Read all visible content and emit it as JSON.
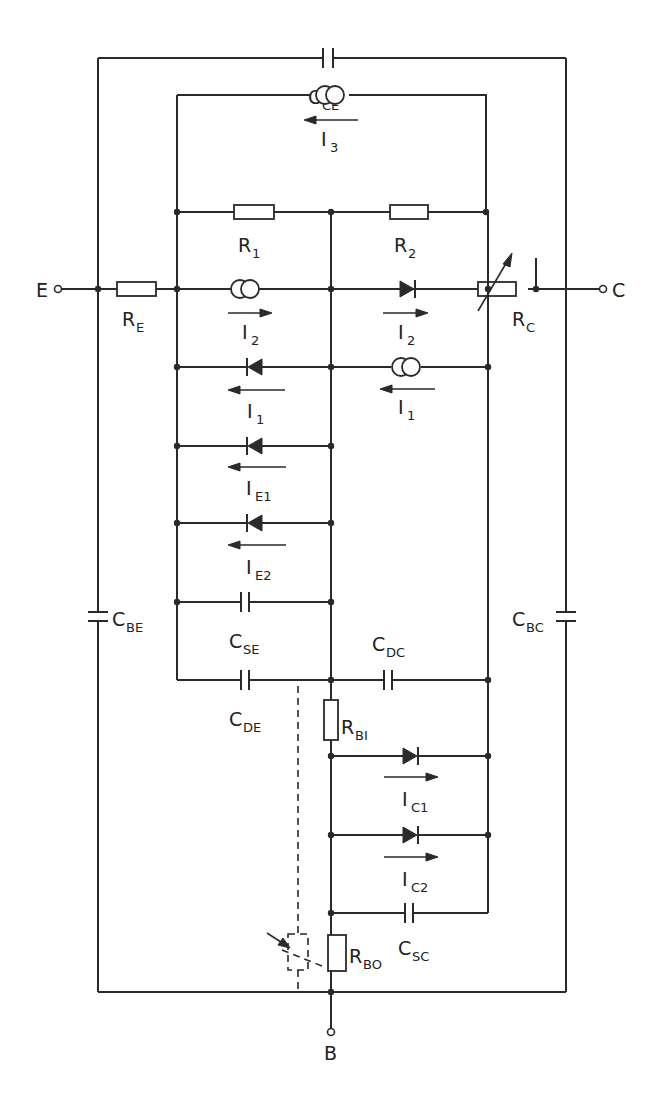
{
  "figure": {
    "type": "equivalent-circuit-schematic",
    "colors": {
      "line": "#2a2a2a",
      "background": "#ffffff"
    }
  },
  "terminals": {
    "emitter": {
      "label": "E"
    },
    "collector": {
      "label": "C"
    },
    "base": {
      "label": "B"
    }
  },
  "components": {
    "C_CE": {
      "main": "C",
      "sub": "CE",
      "kind": "capacitor"
    },
    "I_3": {
      "main": "I",
      "sub": "3",
      "kind": "current-source",
      "arrow": "left"
    },
    "R_1": {
      "main": "R",
      "sub": "1",
      "kind": "resistor"
    },
    "R_2": {
      "main": "R",
      "sub": "2",
      "kind": "resistor"
    },
    "R_E": {
      "main": "R",
      "sub": "E",
      "kind": "resistor"
    },
    "R_C": {
      "main": "R",
      "sub": "C",
      "kind": "variable-resistor"
    },
    "I_2_source": {
      "main": "I",
      "sub": "2",
      "kind": "current-source",
      "arrow": "right"
    },
    "I_2_diode": {
      "main": "I",
      "sub": "2",
      "kind": "diode",
      "arrow": "right"
    },
    "I_1_diode": {
      "main": "I",
      "sub": "1",
      "kind": "diode",
      "arrow": "left"
    },
    "I_1_source": {
      "main": "I",
      "sub": "1",
      "kind": "current-source",
      "arrow": "left"
    },
    "I_E1": {
      "main": "I",
      "sub": "E1",
      "kind": "diode",
      "arrow": "left"
    },
    "I_E2": {
      "main": "I",
      "sub": "E2",
      "kind": "diode",
      "arrow": "left"
    },
    "C_SE": {
      "main": "C",
      "sub": "SE",
      "kind": "capacitor"
    },
    "C_DE": {
      "main": "C",
      "sub": "DE",
      "kind": "capacitor"
    },
    "C_DC": {
      "main": "C",
      "sub": "DC",
      "kind": "capacitor"
    },
    "C_BE": {
      "main": "C",
      "sub": "BE",
      "kind": "capacitor"
    },
    "C_BC": {
      "main": "C",
      "sub": "BC",
      "kind": "capacitor"
    },
    "R_BI": {
      "main": "R",
      "sub": "BI",
      "kind": "resistor"
    },
    "I_C1": {
      "main": "I",
      "sub": "C1",
      "kind": "diode",
      "arrow": "right"
    },
    "I_C2": {
      "main": "I",
      "sub": "C2",
      "kind": "diode",
      "arrow": "right"
    },
    "C_SC": {
      "main": "C",
      "sub": "SC",
      "kind": "capacitor"
    },
    "R_BO": {
      "main": "R",
      "sub": "BO",
      "kind": "resistor",
      "coupled": "dashed-variable-resistor"
    }
  }
}
